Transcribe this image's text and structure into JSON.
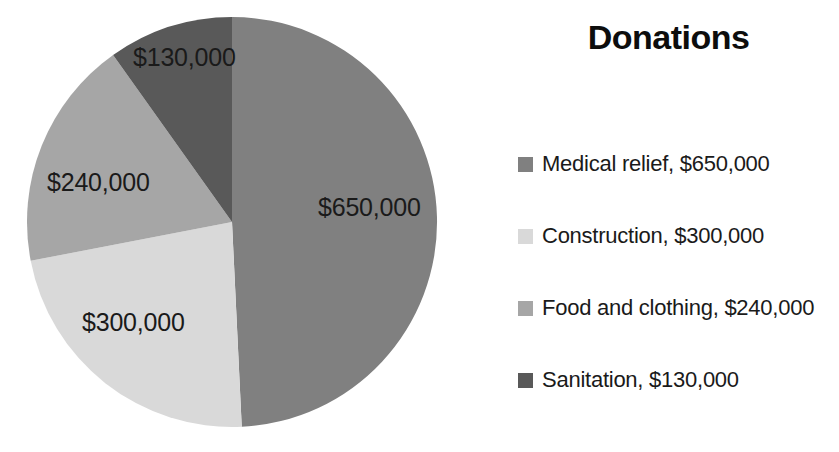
{
  "legend": {
    "title": "Donations",
    "items": [
      {
        "label": "Medical relief, $650,000",
        "color": "#808080",
        "icon": "legend-swatch-icon"
      },
      {
        "label": "Construction, $300,000",
        "color": "#d9d9d9",
        "icon": "legend-swatch-icon"
      },
      {
        "label": "Food and clothing, $240,000",
        "color": "#a6a6a6",
        "icon": "legend-swatch-icon"
      },
      {
        "label": "Sanitation, $130,000",
        "color": "#595959",
        "icon": "legend-swatch-icon"
      }
    ]
  },
  "labels": {
    "medical_relief": "$650,000",
    "construction": "$300,000",
    "food_and_clothing": "$240,000",
    "sanitation": "$130,000"
  },
  "chart_data": {
    "type": "pie",
    "title": "Donations",
    "xlabel": "",
    "ylabel": "",
    "legend_position": "right",
    "grid": false,
    "start_angle_deg": 0,
    "direction": "clockwise",
    "total": 1320000,
    "categories": [
      "Medical relief",
      "Construction",
      "Food and clothing",
      "Sanitation"
    ],
    "values": [
      650000,
      300000,
      240000,
      130000
    ],
    "data_labels": [
      "$650,000",
      "$300,000",
      "$240,000",
      "$130,000"
    ],
    "colors": [
      "#808080",
      "#d9d9d9",
      "#a6a6a6",
      "#595959"
    ],
    "percentages": [
      49.2,
      22.7,
      18.2,
      9.8
    ],
    "legend_entries": [
      "Medical relief, $650,000",
      "Construction, $300,000",
      "Food and clothing, $240,000",
      "Sanitation, $130,000"
    ]
  }
}
